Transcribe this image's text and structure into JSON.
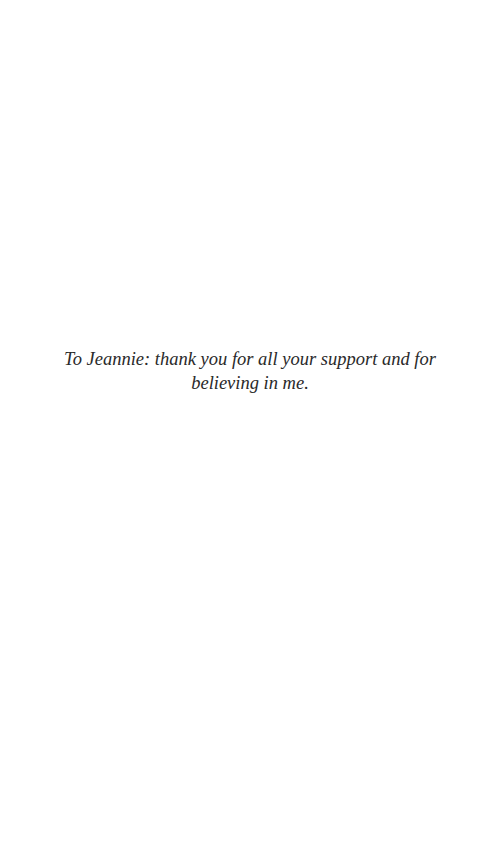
{
  "page": {
    "dedication": "To Jeannie: thank you for all your support and for believing in me."
  }
}
